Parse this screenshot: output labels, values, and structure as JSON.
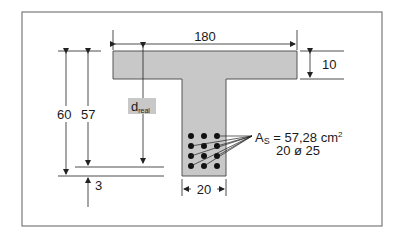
{
  "diagram": {
    "colors": {
      "frame": "#7a7a7a",
      "section_fill": "#c8c8c8",
      "section_stroke": "#555555",
      "line": "#222222",
      "bar": "#111111"
    },
    "dimensions": {
      "flange_width": "180",
      "flange_thickness": "10",
      "web_width": "20",
      "total_height": "60",
      "effective_depth": "57",
      "cover": "3",
      "d_label": "d",
      "d_subscript": "real"
    },
    "reinforcement": {
      "area_label": "A",
      "area_subscript": "S",
      "area_value": " = 57,28 cm",
      "area_unit_sup": "2",
      "bars": "20 ø 25",
      "rows": 4,
      "columns": 3
    }
  }
}
